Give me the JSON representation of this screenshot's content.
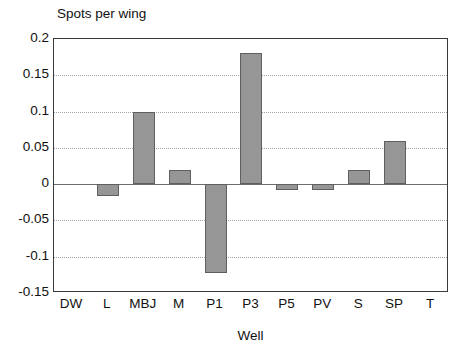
{
  "chart_data": {
    "type": "bar",
    "title": "Spots per wing",
    "xlabel": "Well",
    "ylabel": "",
    "categories": [
      "DW",
      "L",
      "MBJ",
      "M",
      "P1",
      "P3",
      "P5",
      "PV",
      "S",
      "SP",
      "T"
    ],
    "values": [
      0,
      -0.016,
      0.1,
      0.019,
      -0.122,
      0.181,
      -0.008,
      -0.008,
      0.019,
      0.06,
      0
    ],
    "ylim": [
      -0.15,
      0.2
    ],
    "ytick_labels": [
      "0.2",
      "0.15",
      "0.1",
      "0.05",
      "0",
      "-0.05",
      "-0.1",
      "-0.15"
    ],
    "ytick_values": [
      0.2,
      0.15,
      0.1,
      0.05,
      0,
      -0.05,
      -0.1,
      -0.15
    ],
    "grid": true,
    "legend": "none",
    "colors": {
      "bar_fill": "#969696",
      "bar_edge": "#5f5f5f",
      "gridline": "#9aa6b0",
      "axis": "#3a3a3a",
      "zero_line": "#6d6d6d",
      "text": "#111111",
      "background": "#ffffff"
    }
  }
}
